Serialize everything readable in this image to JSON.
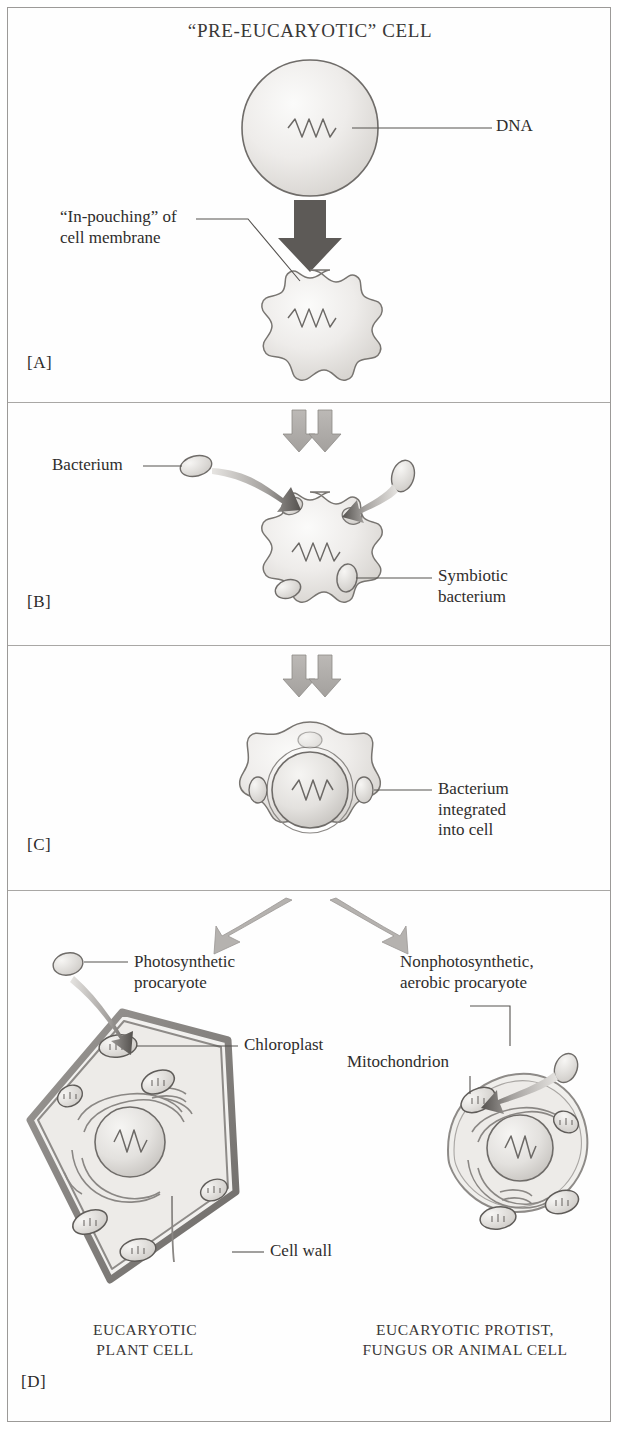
{
  "figure": {
    "title": "“PRE-EUCARYOTIC” CELL",
    "type": "endosymbiosis-diagram",
    "colors": {
      "outline": "#6f6c69",
      "membrane": "#8a8784",
      "fill_light": "#f2f1ef",
      "fill_mid": "#dedcd9",
      "arrow": "#9c9a97",
      "dark_arrow": "#5c5956",
      "text": "#2f2d2c",
      "frame": "#9c9a98"
    },
    "panels": [
      {
        "tag": "[A]",
        "name": "panel-a",
        "labels": [
          {
            "text": "DNA",
            "name": "label-dna"
          },
          {
            "text": "“In-pouching” of\ncell membrane",
            "name": "label-in-pouching"
          }
        ]
      },
      {
        "tag": "[B]",
        "name": "panel-b",
        "labels": [
          {
            "text": "Bacterium",
            "name": "label-bacterium"
          },
          {
            "text": "Symbiotic\nbacterium",
            "name": "label-symbiotic-bacterium"
          }
        ]
      },
      {
        "tag": "[C]",
        "name": "panel-c",
        "labels": [
          {
            "text": "Bacterium\nintegrated\ninto cell",
            "name": "label-bacterium-integrated"
          }
        ]
      },
      {
        "tag": "[D]",
        "name": "panel-d",
        "labels": [
          {
            "text": "Photosynthetic\nprocaryote",
            "name": "label-photosynthetic-procaryote"
          },
          {
            "text": "Nonphotosynthetic,\naerobic procaryote",
            "name": "label-nonphotosynthetic-procaryote"
          },
          {
            "text": "Chloroplast",
            "name": "label-chloroplast"
          },
          {
            "text": "Mitochondrion",
            "name": "label-mitochondrion"
          },
          {
            "text": "Cell wall",
            "name": "label-cell-wall"
          }
        ],
        "captions": [
          {
            "text": "EUCARYOTIC\nPLANT CELL",
            "name": "caption-plant-cell"
          },
          {
            "text": "EUCARYOTIC PROTIST,\nFUNGUS OR ANIMAL CELL",
            "name": "caption-animal-cell"
          }
        ]
      }
    ]
  }
}
